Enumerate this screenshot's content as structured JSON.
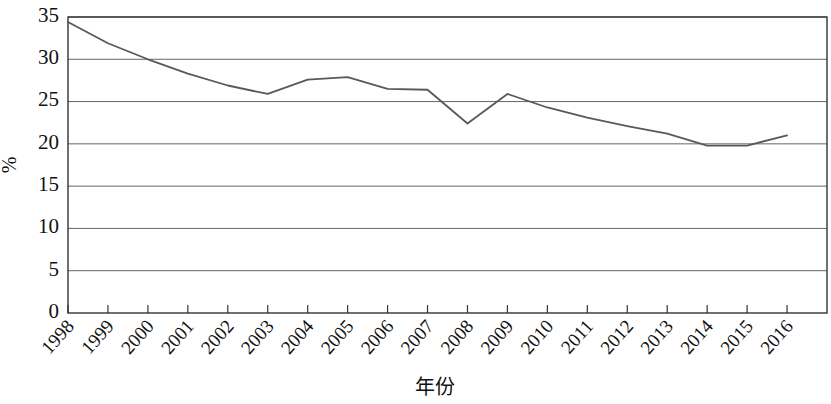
{
  "chart_data": {
    "type": "line",
    "title": "",
    "subtitle": "",
    "xlabel": "年份",
    "ylabel": "%",
    "x": [
      1998,
      1999,
      2000,
      2001,
      2002,
      2003,
      2004,
      2005,
      2006,
      2007,
      2008,
      2009,
      2010,
      2011,
      2012,
      2013,
      2014,
      2015,
      2016
    ],
    "categories": [
      "1998",
      "1999",
      "2000",
      "2001",
      "2002",
      "2003",
      "2004",
      "2005",
      "2006",
      "2007",
      "2008",
      "2009",
      "2010",
      "2011",
      "2012",
      "2013",
      "2014",
      "2015",
      "2016"
    ],
    "values": [
      34.4,
      31.9,
      30.0,
      28.3,
      26.9,
      25.9,
      27.6,
      27.9,
      26.5,
      26.4,
      22.4,
      25.9,
      24.3,
      23.1,
      22.1,
      21.2,
      19.8,
      19.8,
      21.0
    ],
    "series": [
      {
        "name": "",
        "color": "#595959",
        "values": [
          34.4,
          31.9,
          30.0,
          28.3,
          26.9,
          25.9,
          27.6,
          27.9,
          26.5,
          26.4,
          22.4,
          25.9,
          24.3,
          23.1,
          22.1,
          21.2,
          19.8,
          19.8,
          21.0
        ]
      }
    ],
    "ylim": [
      0,
      35
    ],
    "yticks": [
      0,
      5,
      10,
      15,
      20,
      25,
      30,
      35
    ],
    "ytick_labels": [
      "0",
      "5",
      "10",
      "15",
      "20",
      "25",
      "30",
      "35"
    ],
    "grid": true,
    "grid_axis": "y",
    "legend": false,
    "legend_position": "none",
    "xtick_rotation": 48,
    "axis_color": "#333333",
    "grid_color": "#666666",
    "background": "#ffffff"
  }
}
